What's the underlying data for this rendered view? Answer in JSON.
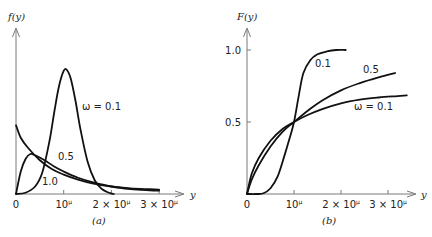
{
  "chart_data": [
    {
      "type": "line",
      "panel_label": "(a)",
      "title": "",
      "xlabel": "y",
      "ylabel": "f(y)",
      "xlim": [
        0,
        3.5
      ],
      "ylim": [
        0,
        1.0
      ],
      "x_unit_note": "x in units of 10^μ",
      "xticks": [
        {
          "value": 0,
          "label": "0"
        },
        {
          "value": 1,
          "label": "10",
          "sup": "μ"
        },
        {
          "value": 2,
          "label": "2 × 10",
          "sup": "μ"
        },
        {
          "value": 3,
          "label": "3 × 10",
          "sup": "μ"
        }
      ],
      "grid": false,
      "series": [
        {
          "name": "ω = 0.1",
          "label": "ω = 0.1",
          "x": [
            0,
            0.2,
            0.4,
            0.55,
            0.7,
            0.8,
            0.9,
            1.0,
            1.07,
            1.15,
            1.25,
            1.35,
            1.5,
            1.65,
            1.8,
            1.95,
            2.05
          ],
          "y": [
            0,
            0.01,
            0.06,
            0.17,
            0.42,
            0.65,
            0.86,
            0.985,
            0.99,
            0.92,
            0.74,
            0.52,
            0.26,
            0.11,
            0.04,
            0.01,
            0
          ]
        },
        {
          "name": "ω = 0.5",
          "label": "0.5",
          "x": [
            0,
            0.1,
            0.2,
            0.3,
            0.4,
            0.6,
            0.8,
            1.0,
            1.3,
            1.6,
            2.0,
            2.4,
            2.8,
            3.0
          ],
          "y": [
            0,
            0.18,
            0.28,
            0.32,
            0.31,
            0.27,
            0.22,
            0.18,
            0.13,
            0.095,
            0.06,
            0.04,
            0.03,
            0.027
          ]
        },
        {
          "name": "ω = 1.0",
          "label": "1.0",
          "x": [
            0,
            0.1,
            0.25,
            0.5,
            0.75,
            1.0,
            1.3,
            1.6,
            2.0,
            2.4,
            2.8,
            3.0
          ],
          "y": [
            0.55,
            0.45,
            0.37,
            0.27,
            0.2,
            0.155,
            0.115,
            0.085,
            0.06,
            0.045,
            0.038,
            0.035
          ]
        }
      ]
    },
    {
      "type": "line",
      "panel_label": "(b)",
      "title": "",
      "xlabel": "y",
      "ylabel": "F(y)",
      "xlim": [
        0,
        3.5
      ],
      "ylim": [
        0,
        1.1
      ],
      "yticks": [
        {
          "value": 0.5,
          "label": "0.5"
        },
        {
          "value": 1.0,
          "label": "1.0"
        }
      ],
      "xticks": [
        {
          "value": 0,
          "label": "0"
        },
        {
          "value": 1,
          "label": "10",
          "sup": "μ"
        },
        {
          "value": 2,
          "label": "2 × 10",
          "sup": "μ"
        },
        {
          "value": 3,
          "label": "3 × 10",
          "sup": "μ"
        }
      ],
      "grid": false,
      "series": [
        {
          "name": "ω = 0.1",
          "label": "0.1",
          "x": [
            0,
            0.2,
            0.35,
            0.5,
            0.65,
            0.8,
            0.9,
            1.0,
            1.1,
            1.2,
            1.35,
            1.5,
            1.7,
            1.9,
            2.1
          ],
          "y": [
            0,
            0,
            0.005,
            0.04,
            0.12,
            0.27,
            0.38,
            0.5,
            0.68,
            0.84,
            0.93,
            0.97,
            0.99,
            1.0,
            1.0
          ]
        },
        {
          "name": "ω = 0.5",
          "label": "0.5",
          "x": [
            0,
            0.1,
            0.25,
            0.5,
            0.75,
            1.0,
            1.3,
            1.6,
            2.0,
            2.4,
            2.8,
            3.15
          ],
          "y": [
            0,
            0.1,
            0.2,
            0.33,
            0.43,
            0.5,
            0.58,
            0.65,
            0.72,
            0.77,
            0.81,
            0.84
          ]
        },
        {
          "name": "ω = 1.0",
          "label": "ω = 0.1",
          "x": [
            0,
            0.1,
            0.25,
            0.5,
            0.75,
            1.0,
            1.3,
            1.6,
            2.0,
            2.4,
            2.8,
            3.2,
            3.4
          ],
          "y": [
            0,
            0.14,
            0.25,
            0.37,
            0.45,
            0.5,
            0.55,
            0.59,
            0.63,
            0.655,
            0.67,
            0.68,
            0.685
          ]
        }
      ]
    }
  ]
}
